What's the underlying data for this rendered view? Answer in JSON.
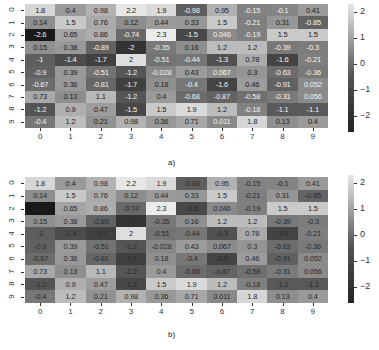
{
  "chart_data": [
    {
      "type": "heatmap",
      "title": "",
      "caption": "a)",
      "x_tick_labels": [
        "0",
        "1",
        "2",
        "3",
        "4",
        "5",
        "6",
        "7",
        "8",
        "9"
      ],
      "y_tick_labels": [
        "0",
        "1",
        "2",
        "3",
        "4",
        "5",
        "6",
        "7",
        "8",
        "9"
      ],
      "colorbar": {
        "ticks": [
          "2",
          "1",
          "0",
          "-1",
          "-2"
        ],
        "range": [
          -2.6,
          2.3
        ],
        "colormap": "grayscale (light=high, dark=low)"
      },
      "annotation_text": "contrast-adjusted (white on dark, black on light)",
      "values": [
        [
          1.8,
          0.4,
          0.98,
          2.2,
          1.9,
          -0.98,
          0.95,
          -0.15,
          -0.1,
          0.41
        ],
        [
          0.14,
          1.5,
          0.76,
          0.12,
          0.44,
          0.33,
          1.5,
          -0.21,
          0.31,
          -0.85
        ],
        [
          -2.6,
          0.65,
          0.86,
          -0.74,
          2.3,
          -1.5,
          0.046,
          -0.19,
          1.5,
          1.5
        ],
        [
          0.15,
          0.38,
          -0.89,
          -2,
          -0.35,
          0.16,
          1.2,
          1.2,
          -0.39,
          -0.3
        ],
        [
          -1,
          -1.4,
          -1.7,
          2,
          -0.51,
          -0.44,
          -1.3,
          0.78,
          -1.6,
          -0.21
        ],
        [
          -0.9,
          0.39,
          -0.51,
          -1.2,
          -0.028,
          0.43,
          0.067,
          0.3,
          -0.63,
          -0.36
        ],
        [
          -0.67,
          0.36,
          -0.81,
          -1.7,
          0.18,
          -0.4,
          -1.6,
          0.46,
          -0.91,
          0.052
        ],
        [
          0.73,
          0.13,
          1.1,
          -1.2,
          0.4,
          -0.68,
          -0.87,
          -0.58,
          -0.31,
          0.056
        ],
        [
          -1.2,
          0.9,
          0.47,
          -1.5,
          1.5,
          1.9,
          1.2,
          -0.18,
          -1.1,
          -1.1
        ],
        [
          -0.4,
          1.2,
          0.21,
          0.98,
          0.36,
          0.71,
          0.011,
          1.8,
          0.13,
          0.4
        ]
      ]
    },
    {
      "type": "heatmap",
      "title": "",
      "caption": "b)",
      "x_tick_labels": [
        "0",
        "1",
        "2",
        "3",
        "4",
        "5",
        "6",
        "7",
        "8",
        "9"
      ],
      "y_tick_labels": [
        "0",
        "1",
        "2",
        "3",
        "4",
        "5",
        "6",
        "7",
        "8",
        "9"
      ],
      "colorbar": {
        "ticks": [
          "2",
          "1",
          "0",
          "-1",
          "-2"
        ],
        "range": [
          -2.6,
          2.3
        ],
        "colormap": "grayscale (light=high, dark=low)"
      },
      "annotation_text": "uniform dark text (low contrast on dark cells)",
      "values": [
        [
          1.8,
          0.4,
          0.98,
          2.2,
          1.9,
          -0.98,
          0.95,
          -0.15,
          -0.1,
          0.41
        ],
        [
          0.14,
          1.5,
          0.76,
          0.12,
          0.44,
          0.33,
          1.5,
          -0.21,
          0.31,
          -0.85
        ],
        [
          -2.6,
          0.65,
          0.86,
          -0.74,
          2.3,
          -1.5,
          0.046,
          -0.19,
          1.5,
          1.5
        ],
        [
          0.15,
          0.38,
          -0.89,
          -2,
          -0.35,
          0.16,
          1.2,
          1.2,
          -0.39,
          -0.3
        ],
        [
          -1,
          -1.4,
          -1.7,
          2,
          -0.51,
          -0.44,
          -1.3,
          0.78,
          -1.6,
          -0.21
        ],
        [
          -0.9,
          0.39,
          -0.51,
          -1.2,
          -0.028,
          0.43,
          0.067,
          0.3,
          -0.63,
          -0.36
        ],
        [
          -0.67,
          0.36,
          -0.81,
          -1.7,
          0.18,
          -0.4,
          -1.6,
          0.46,
          -0.91,
          0.052
        ],
        [
          0.73,
          0.13,
          1.1,
          -1.2,
          0.4,
          -0.68,
          -0.87,
          -0.58,
          -0.31,
          0.056
        ],
        [
          -1.2,
          0.9,
          0.47,
          -1.5,
          1.5,
          1.9,
          1.2,
          -0.18,
          -1.1,
          -1.1
        ],
        [
          -0.4,
          1.2,
          0.21,
          0.98,
          0.36,
          0.71,
          0.011,
          1.8,
          0.13,
          0.4
        ]
      ]
    }
  ],
  "panels": [
    {
      "caption": "a)",
      "top": 4,
      "height": 124,
      "cbar_top": 4,
      "cbar_height": 128,
      "text_mode": "contrast",
      "caption_x": 168,
      "caption_y": 158
    },
    {
      "caption": "b)",
      "top": 177,
      "height": 126,
      "cbar_top": 175,
      "cbar_height": 128,
      "text_mode": "dark",
      "caption_x": 168,
      "caption_y": 330
    }
  ]
}
